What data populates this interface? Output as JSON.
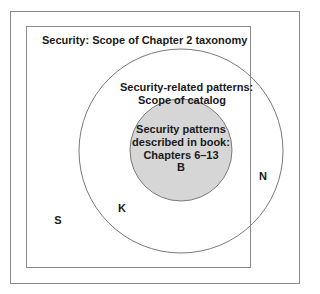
{
  "diagram": {
    "type": "nested-venn",
    "regions": {
      "outer_set": {
        "label": "Security: Scope of Chapter 2 taxonomy",
        "letter": "S"
      },
      "middle_set": {
        "label_line1": "Security-related patterns:",
        "label_line2": "Scope of catalog",
        "letter": "K"
      },
      "inner_set": {
        "label_line1": "Security patterns",
        "label_line2": "described in book:",
        "label_line3": "Chapters 6–13",
        "letter": "B"
      },
      "outside_label": {
        "letter": "N"
      }
    },
    "colors": {
      "stroke": "#7a7a7a",
      "inner_fill": "#d6d6d6",
      "text": "#1a1a1a"
    }
  }
}
